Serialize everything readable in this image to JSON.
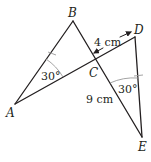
{
  "diagram": {
    "type": "geometry",
    "points": {
      "A": {
        "label": "A",
        "x": 15,
        "y": 104
      },
      "B": {
        "label": "B",
        "x": 73,
        "y": 21
      },
      "C": {
        "label": "C",
        "x": 96,
        "y": 60
      },
      "D": {
        "label": "D",
        "x": 135,
        "y": 37
      },
      "E": {
        "label": "E",
        "x": 142,
        "y": 137
      }
    },
    "segments": [
      {
        "from": "A",
        "to": "B"
      },
      {
        "from": "A",
        "to": "D"
      },
      {
        "from": "B",
        "to": "E"
      },
      {
        "from": "D",
        "to": "E"
      }
    ],
    "measurements": {
      "CD": "4 cm",
      "CE": "9 cm"
    },
    "angles": {
      "A": "30°",
      "E": "30°"
    },
    "colors": {
      "line": "#231f20",
      "arc": "#9a9a9a"
    }
  }
}
